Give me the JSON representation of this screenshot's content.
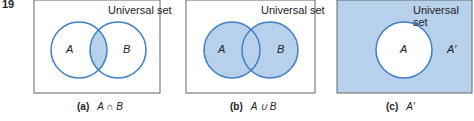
{
  "figure_number": "19",
  "colors": {
    "fill": "#b7d0ec",
    "stroke": "#3f7fc6",
    "frame": "#666666"
  },
  "panels": [
    {
      "label": "Universal set",
      "set_a": "A",
      "set_b": "B",
      "caption_tag": "(a)",
      "caption_expr": "A ∩ B"
    },
    {
      "label": "Universal set",
      "set_a": "A",
      "set_b": "B",
      "caption_tag": "(b)",
      "caption_expr": "A ∪ B"
    },
    {
      "label": "Universal set",
      "set_a": "A",
      "complement": "A′",
      "caption_tag": "(c)",
      "caption_expr": "A′"
    }
  ]
}
